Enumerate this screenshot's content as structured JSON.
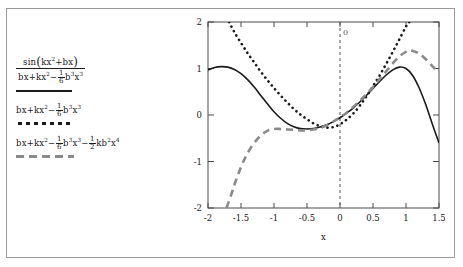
{
  "figure": {
    "background": "#ffffff",
    "frame_color": "#9a9a9a"
  },
  "legend": {
    "entries": [
      {
        "id": "exact",
        "style": "solid",
        "color": "#1a1a1a",
        "expression": "sin(kx^2+bx)",
        "numerator": "sin(kx²+bx)",
        "denominator": "bx+kx²-(1/6)b³x³",
        "parts": {
          "num_fn": "sin",
          "num_arg_a": "kx",
          "num_arg_a_exp": "2",
          "num_arg_b": "+bx",
          "den_t1": "bx+kx",
          "den_t1_exp": "2",
          "den_minus": "−",
          "den_frac_num": "1",
          "den_frac_den": "6",
          "den_t2_b": "b",
          "den_t2_b_exp": "3",
          "den_t2_x": "x",
          "den_t2_x_exp": "3"
        }
      },
      {
        "id": "taylor3",
        "style": "dotted",
        "color": "#1a1a1a",
        "expression": "bx+kx^2-(1/6)b^3x^3",
        "parts": {
          "t1": "bx+kx",
          "t1_exp": "2",
          "minus1": "−",
          "f1_num": "1",
          "f1_den": "6",
          "b1": "b",
          "b1_exp": "3",
          "x1": "x",
          "x1_exp": "3"
        }
      },
      {
        "id": "taylor4",
        "style": "dashed",
        "color": "#8a8a8a",
        "expression": "bx+kx^2-(1/6)b^3x^3-(1/2)kb^2x^4",
        "parts": {
          "t1": "bx+kx",
          "t1_exp": "2",
          "minus1": "−",
          "f1_num": "1",
          "f1_den": "6",
          "b1": "b",
          "b1_exp": "3",
          "x1": "x",
          "x1_exp": "3",
          "minus2": "−",
          "f2_num": "1",
          "f2_den": "2",
          "kb": "kb",
          "kb_exp": "2",
          "x2": "x",
          "x2_exp": "4"
        }
      }
    ]
  },
  "chart_data": {
    "type": "line",
    "title": "",
    "xlabel": "x",
    "ylabel": "",
    "xlim": [
      -2,
      1.5
    ],
    "ylim": [
      -2,
      2
    ],
    "grid": false,
    "legend_position": "left-outside",
    "xticks": [
      -2,
      -1.5,
      -1,
      -0.5,
      0,
      0.5,
      1,
      1.5
    ],
    "xticklabels": [
      "-2",
      "-1.5",
      "-1",
      "-0.5",
      "0",
      "0.5",
      "1",
      "1.5"
    ],
    "yticks": [
      -2,
      -1,
      0,
      1,
      2
    ],
    "yticklabels": [
      "-2",
      "-1",
      "0",
      "1",
      "2"
    ],
    "annotations": [
      {
        "text": "0",
        "x": 0,
        "y": 1.72,
        "type": "vertical-reference-label"
      }
    ],
    "reference_lines": [
      {
        "orientation": "vertical",
        "x": 0,
        "style": "dashed",
        "color": "#555555"
      }
    ],
    "series": [
      {
        "name": "sin(kx^2+bx) / (bx+kx^2-(1/6)b^3x^3)",
        "style": "solid",
        "color": "#1a1a1a",
        "x": [
          -2,
          -1.9,
          -1.8,
          -1.7,
          -1.6,
          -1.5,
          -1.4,
          -1.3,
          -1.2,
          -1.1,
          -1,
          -0.9,
          -0.8,
          -0.7,
          -0.6,
          -0.5,
          -0.4,
          -0.3,
          -0.2,
          -0.1,
          0,
          0.1,
          0.2,
          0.3,
          0.4,
          0.5,
          0.6,
          0.7,
          0.8,
          0.9,
          1,
          1.1,
          1.2,
          1.3,
          1.4,
          1.5
        ],
        "y": [
          0.97,
          1.02,
          1.04,
          1.03,
          0.98,
          0.89,
          0.76,
          0.6,
          0.42,
          0.24,
          0.07,
          -0.07,
          -0.18,
          -0.25,
          -0.29,
          -0.3,
          -0.29,
          -0.26,
          -0.21,
          -0.14,
          -0.06,
          0.04,
          0.15,
          0.28,
          0.42,
          0.57,
          0.72,
          0.86,
          0.97,
          1.03,
          1.0,
          0.85,
          0.58,
          0.22,
          -0.2,
          -0.6
        ]
      },
      {
        "name": "bx+kx^2-(1/6)b^3x^3",
        "style": "dotted",
        "color": "#1a1a1a",
        "x": [
          -1.68,
          -1.6,
          -1.5,
          -1.4,
          -1.3,
          -1.2,
          -1.1,
          -1,
          -0.9,
          -0.8,
          -0.7,
          -0.6,
          -0.5,
          -0.4,
          -0.3,
          -0.2,
          -0.1,
          0,
          0.1,
          0.2,
          0.3,
          0.4,
          0.5,
          0.6,
          0.7,
          0.8,
          0.9,
          1,
          1.05
        ],
        "y": [
          2.0,
          1.78,
          1.55,
          1.33,
          1.13,
          0.93,
          0.75,
          0.58,
          0.42,
          0.27,
          0.13,
          0.01,
          -0.09,
          -0.18,
          -0.24,
          -0.27,
          -0.26,
          -0.2,
          -0.1,
          0.03,
          0.2,
          0.4,
          0.62,
          0.85,
          1.1,
          1.36,
          1.63,
          1.9,
          2.0
        ]
      },
      {
        "name": "bx+kx^2-(1/6)b^3x^3-(1/2)kb^2x^4",
        "style": "dashed",
        "color": "#8a8a8a",
        "x": [
          -1.72,
          -1.65,
          -1.6,
          -1.55,
          -1.5,
          -1.45,
          -1.4,
          -1.3,
          -1.2,
          -1.1,
          -1,
          -0.9,
          -0.8,
          -0.7,
          -0.6,
          -0.5,
          -0.4,
          -0.3,
          -0.2,
          -0.1,
          0,
          0.1,
          0.2,
          0.3,
          0.4,
          0.5,
          0.6,
          0.7,
          0.8,
          0.9,
          1,
          1.05,
          1.1,
          1.2,
          1.3,
          1.4,
          1.5
        ],
        "y": [
          -2.0,
          -1.72,
          -1.5,
          -1.3,
          -1.12,
          -0.96,
          -0.82,
          -0.6,
          -0.44,
          -0.34,
          -0.3,
          -0.3,
          -0.31,
          -0.32,
          -0.33,
          -0.33,
          -0.31,
          -0.28,
          -0.22,
          -0.14,
          -0.05,
          0.05,
          0.17,
          0.3,
          0.45,
          0.6,
          0.77,
          0.94,
          1.11,
          1.26,
          1.36,
          1.39,
          1.38,
          1.32,
          1.2,
          1.05,
          0.9
        ]
      }
    ]
  }
}
